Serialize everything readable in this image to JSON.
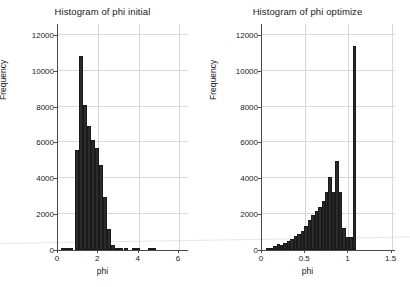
{
  "figure": {
    "background": "#ffffff",
    "bar_color": "#2b2b2b",
    "axis_color": "#4a4a4a",
    "grid_color": "#d8d8dc",
    "width": 410,
    "height": 287
  },
  "chart_data": [
    {
      "type": "bar",
      "panel": "left",
      "title": "Histogram of phi initial",
      "xlabel": "phi",
      "ylabel": "Frequency",
      "xlim": [
        0,
        6.5
      ],
      "ylim": [
        0,
        12600
      ],
      "grid": true,
      "xticks": [
        0,
        2,
        4,
        6
      ],
      "xticklabels": [
        "0",
        "2",
        "4",
        "6"
      ],
      "yticks": [
        0,
        2000,
        4000,
        6000,
        8000,
        10000,
        12000
      ],
      "yticklabels": [
        "0",
        "2000",
        "4000",
        "6000",
        "8000",
        "10000",
        "12000"
      ],
      "bin_width": 0.2,
      "bin_left_edges": [
        0.2,
        0.4,
        0.6,
        0.9,
        1.1,
        1.3,
        1.5,
        1.7,
        1.9,
        2.1,
        2.3,
        2.5,
        2.7,
        2.9,
        3.1,
        3.3,
        3.7,
        3.9,
        4.5,
        4.7
      ],
      "values": [
        30,
        30,
        30,
        5600,
        10800,
        8100,
        6900,
        6150,
        5700,
        4750,
        2950,
        1150,
        300,
        90,
        60,
        40,
        40,
        30,
        30,
        30
      ]
    },
    {
      "type": "bar",
      "panel": "right",
      "title": "Histogram of phi optimize",
      "xlabel": "phi",
      "ylabel": "Frequency",
      "xlim": [
        0,
        1.55
      ],
      "ylim": [
        0,
        12600
      ],
      "grid": true,
      "xticks": [
        0,
        0.5,
        1,
        1.5
      ],
      "xticklabels": [
        "0",
        "0.5",
        "1",
        "1.5"
      ],
      "yticks": [
        0,
        2000,
        4000,
        6000,
        8000,
        10000,
        12000
      ],
      "yticklabels": [
        "0",
        "2000",
        "4000",
        "6000",
        "8000",
        "10000",
        "12000"
      ],
      "bin_width": 0.04,
      "bin_left_edges": [
        0.06,
        0.1,
        0.14,
        0.18,
        0.22,
        0.26,
        0.3,
        0.34,
        0.38,
        0.42,
        0.46,
        0.5,
        0.54,
        0.58,
        0.62,
        0.66,
        0.7,
        0.74,
        0.78,
        0.82,
        0.86,
        0.9,
        0.94,
        0.98,
        1.02,
        1.06
      ],
      "values": [
        60,
        130,
        230,
        330,
        300,
        400,
        500,
        620,
        760,
        900,
        1070,
        1320,
        1650,
        1950,
        2200,
        2400,
        2750,
        3250,
        4050,
        3250,
        4950,
        3250,
        1200,
        750,
        750,
        11400
      ]
    }
  ]
}
